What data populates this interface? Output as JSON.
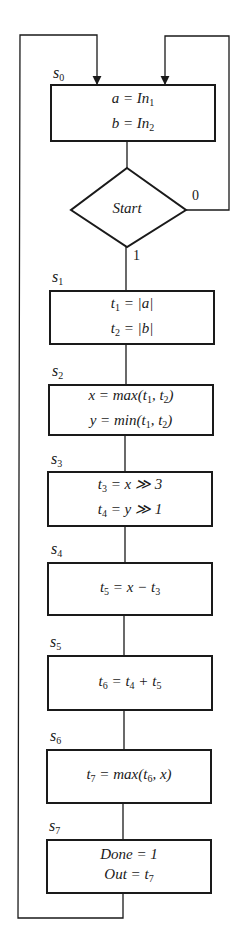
{
  "diagram": {
    "type": "flowchart (ASM / state chart)",
    "states": [
      {
        "id": "s0",
        "label": "s",
        "sub": "0",
        "lines": [
          [
            {
              "t": "a = In"
            },
            {
              "sub": "1"
            }
          ],
          [
            {
              "t": "b = In"
            },
            {
              "sub": "2"
            }
          ]
        ]
      },
      {
        "id": "s1",
        "label": "s",
        "sub": "1",
        "lines": [
          [
            {
              "t": "t"
            },
            {
              "sub": "1"
            },
            {
              "t": " = |a|"
            }
          ],
          [
            {
              "t": "t"
            },
            {
              "sub": "2"
            },
            {
              "t": " = |b|"
            }
          ]
        ]
      },
      {
        "id": "s2",
        "label": "s",
        "sub": "2",
        "lines": [
          [
            {
              "t": "x = max(t"
            },
            {
              "sub": "1"
            },
            {
              "t": ", t"
            },
            {
              "sub": "2"
            },
            {
              "t": ")"
            }
          ],
          [
            {
              "t": "y = min(t"
            },
            {
              "sub": "1"
            },
            {
              "t": ", t"
            },
            {
              "sub": "2"
            },
            {
              "t": ")"
            }
          ]
        ]
      },
      {
        "id": "s3",
        "label": "s",
        "sub": "3",
        "lines": [
          [
            {
              "t": "t"
            },
            {
              "sub": "3"
            },
            {
              "t": " = x ≫ 3"
            }
          ],
          [
            {
              "t": "t"
            },
            {
              "sub": "4"
            },
            {
              "t": " = y ≫ 1"
            }
          ]
        ]
      },
      {
        "id": "s4",
        "label": "s",
        "sub": "4",
        "lines": [
          [
            {
              "t": "t"
            },
            {
              "sub": "5"
            },
            {
              "t": " = x − t"
            },
            {
              "sub": "3"
            }
          ]
        ]
      },
      {
        "id": "s5",
        "label": "s",
        "sub": "5",
        "lines": [
          [
            {
              "t": "t"
            },
            {
              "sub": "6"
            },
            {
              "t": " = t"
            },
            {
              "sub": "4"
            },
            {
              "t": " + t"
            },
            {
              "sub": "5"
            }
          ]
        ]
      },
      {
        "id": "s6",
        "label": "s",
        "sub": "6",
        "lines": [
          [
            {
              "t": "t"
            },
            {
              "sub": "7"
            },
            {
              "t": " = max(t"
            },
            {
              "sub": "6"
            },
            {
              "t": ", x)"
            }
          ]
        ]
      },
      {
        "id": "s7",
        "label": "s",
        "sub": "7",
        "lines": [
          [
            {
              "t": "Done = 1"
            }
          ],
          [
            {
              "t": "Out = t"
            },
            {
              "sub": "7"
            }
          ]
        ]
      }
    ],
    "decision": {
      "label": "Start",
      "true_label": "1",
      "false_label": "0"
    },
    "text": {
      "s0_line1": "a = In",
      "s0_line1_sub": "1",
      "s0_line2": "b = In",
      "s0_line2_sub": "2",
      "start": "Start",
      "branch_0": "0",
      "branch_1": "1"
    },
    "colors": {
      "stroke": "#1a1a1a",
      "background": "#ffffff"
    }
  }
}
